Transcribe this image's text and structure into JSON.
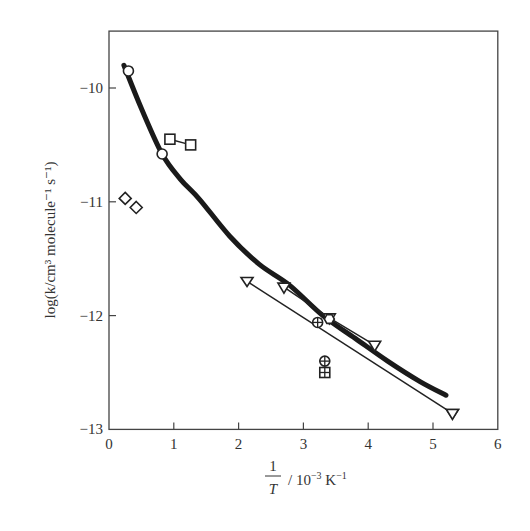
{
  "chart_data": {
    "type": "scatter",
    "title": "",
    "xlabel": "1/T / 10^-3 K^-1",
    "xlabel_parts": {
      "numerator": "1",
      "denominator": "T",
      "unit": "/ 10",
      "exp": "−3",
      "unit2": " K",
      "exp2": "−1"
    },
    "ylabel": "log(k/cm³ molecule⁻¹ s⁻¹)",
    "xlim": [
      0,
      6
    ],
    "ylim": [
      -13,
      -9.5
    ],
    "xticks": [
      0,
      1,
      2,
      3,
      4,
      5,
      6
    ],
    "yticks": [
      -10,
      -11,
      -12,
      -13
    ],
    "xtick_labels": [
      "0",
      "1",
      "2",
      "3",
      "4",
      "5",
      "6"
    ],
    "ytick_labels": [
      "−10",
      "−11",
      "−12",
      "−13"
    ],
    "grid": false,
    "legend": "none",
    "series": [
      {
        "name": "fit-curve",
        "style": "thick-line",
        "x": [
          0.23,
          0.5,
          0.82,
          1.1,
          1.4,
          1.86,
          2.32,
          2.78,
          3.3,
          3.8,
          4.3,
          4.8,
          5.2
        ],
        "y": [
          -9.8,
          -10.18,
          -10.58,
          -10.8,
          -10.98,
          -11.3,
          -11.55,
          -11.73,
          -12.0,
          -12.2,
          -12.4,
          -12.58,
          -12.7
        ]
      },
      {
        "name": "open-circles",
        "marker": "circle",
        "x": [
          0.3,
          0.82
        ],
        "y": [
          -9.85,
          -10.58
        ]
      },
      {
        "name": "open-squares",
        "marker": "square",
        "connected": true,
        "x": [
          0.94,
          1.26
        ],
        "y": [
          -10.45,
          -10.5
        ]
      },
      {
        "name": "open-diamonds",
        "marker": "diamond",
        "x": [
          0.25,
          0.42
        ],
        "y": [
          -10.97,
          -11.05
        ]
      },
      {
        "name": "up-triangles-line",
        "marker": "triangle-left",
        "connected": true,
        "x": [
          2.13,
          5.3
        ],
        "y": [
          -11.7,
          -12.86
        ]
      },
      {
        "name": "down-triangles-line",
        "marker": "triangle-down",
        "connected": true,
        "x": [
          2.7,
          3.4,
          4.1
        ],
        "y": [
          -11.75,
          -12.02,
          -12.26
        ]
      },
      {
        "name": "circle-cross",
        "marker": "circle-plus",
        "x": [
          3.22,
          3.33
        ],
        "y": [
          -12.06,
          -12.4
        ]
      },
      {
        "name": "hexagon",
        "marker": "hexagon",
        "x": [
          3.4
        ],
        "y": [
          -12.03
        ]
      },
      {
        "name": "square-grid",
        "marker": "square-plus",
        "x": [
          3.33
        ],
        "y": [
          -12.5
        ]
      },
      {
        "name": "end-triangle",
        "marker": "triangle-down",
        "x": [
          5.3
        ],
        "y": [
          -12.86
        ]
      }
    ]
  }
}
